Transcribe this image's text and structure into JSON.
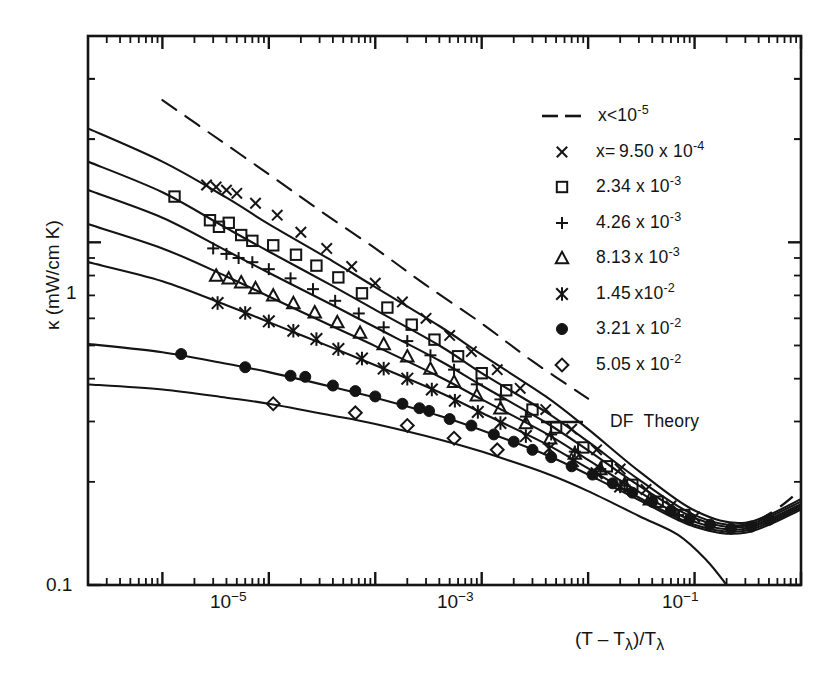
{
  "chart_data": {
    "type": "line",
    "title": "",
    "xlabel": "(T - Tλ)/Tλ",
    "ylabel": "κ (mW/cm K)",
    "xscale": "log",
    "yscale": "log",
    "xlim": [
      2e-07,
      1.0
    ],
    "ylim": [
      0.1,
      4.0
    ],
    "x_tick_labels": [
      "10⁻⁵",
      "10⁻³",
      "10⁻¹"
    ],
    "x_tick_values": [
      1e-05,
      0.001,
      0.1
    ],
    "y_tick_labels": [
      "1",
      "0.1"
    ],
    "y_tick_values": [
      1.0,
      0.1
    ],
    "grid": false,
    "legend_position": "upper-right",
    "series": [
      {
        "name": "x<10⁻⁵",
        "label_html": "x&lt;10<sup>-5</sup>",
        "style": "dashed",
        "marker": "none",
        "points": [
          [
            1e-06,
            2.6
          ],
          [
            3e-06,
            2.05
          ],
          [
            1e-05,
            1.58
          ],
          [
            3e-05,
            1.24
          ],
          [
            0.0001,
            0.96
          ],
          [
            0.0003,
            0.75
          ],
          [
            0.001,
            0.58
          ],
          [
            0.003,
            0.45
          ],
          [
            0.01,
            0.35
          ]
        ]
      },
      {
        "name": "x= 9.50 x 10⁻⁴",
        "label_html": "x=&thinsp;9.50 x 10<sup>-4</sup>",
        "style": "solid",
        "marker": "cross",
        "points": [
          [
            2e-07,
            2.15
          ],
          [
            1e-06,
            1.72
          ],
          [
            4e-06,
            1.35
          ],
          [
            1e-05,
            1.13
          ],
          [
            4e-05,
            0.88
          ],
          [
            0.0001,
            0.74
          ],
          [
            0.0004,
            0.57
          ],
          [
            0.001,
            0.47
          ],
          [
            0.004,
            0.355
          ],
          [
            0.01,
            0.285
          ],
          [
            0.03,
            0.215
          ],
          [
            0.1,
            0.165
          ],
          [
            0.3,
            0.152
          ],
          [
            1.0,
            0.178
          ]
        ],
        "marker_points": [
          [
            2.6e-06,
            1.47
          ],
          [
            3.2e-06,
            1.45
          ],
          [
            4e-06,
            1.42
          ],
          [
            5e-06,
            1.39
          ],
          [
            7.5e-06,
            1.3
          ],
          [
            1.2e-05,
            1.2
          ],
          [
            2e-05,
            1.07
          ],
          [
            3.5e-05,
            0.96
          ],
          [
            6e-05,
            0.85
          ],
          [
            0.0001,
            0.76
          ],
          [
            0.00018,
            0.67
          ],
          [
            0.0003,
            0.6
          ],
          [
            0.0005,
            0.535
          ],
          [
            0.0008,
            0.48
          ],
          [
            0.0014,
            0.425
          ],
          [
            0.0023,
            0.375
          ],
          [
            0.004,
            0.325
          ],
          [
            0.007,
            0.285
          ],
          [
            0.012,
            0.248
          ],
          [
            0.02,
            0.218
          ],
          [
            0.035,
            0.19
          ],
          [
            0.06,
            0.17
          ],
          [
            0.1,
            0.158
          ]
        ]
      },
      {
        "name": "2.34 x 10⁻³",
        "label_html": "2.34 x 10<sup>-3</sup>",
        "style": "solid",
        "marker": "square",
        "points": [
          [
            2e-07,
            1.72
          ],
          [
            1e-06,
            1.4
          ],
          [
            4e-06,
            1.1
          ],
          [
            1e-05,
            0.94
          ],
          [
            4e-05,
            0.745
          ],
          [
            0.0001,
            0.635
          ],
          [
            0.0004,
            0.5
          ],
          [
            0.001,
            0.415
          ],
          [
            0.004,
            0.32
          ],
          [
            0.01,
            0.262
          ],
          [
            0.03,
            0.203
          ],
          [
            0.1,
            0.16
          ],
          [
            0.3,
            0.15
          ],
          [
            1.0,
            0.175
          ]
        ],
        "marker_points": [
          [
            1.3e-06,
            1.36
          ],
          [
            2.8e-06,
            1.16
          ],
          [
            3.4e-06,
            1.11
          ],
          [
            4.2e-06,
            1.14
          ],
          [
            5.5e-06,
            1.05
          ],
          [
            7e-06,
            1.01
          ],
          [
            1.1e-05,
            0.98
          ],
          [
            1.8e-05,
            0.92
          ],
          [
            2.8e-05,
            0.855
          ],
          [
            4.5e-05,
            0.79
          ],
          [
            7.5e-05,
            0.71
          ],
          [
            0.00013,
            0.645
          ],
          [
            0.00022,
            0.575
          ],
          [
            0.00036,
            0.52
          ],
          [
            0.0006,
            0.465
          ],
          [
            0.001,
            0.415
          ],
          [
            0.0017,
            0.37
          ],
          [
            0.003,
            0.325
          ],
          [
            0.005,
            0.288
          ],
          [
            0.009,
            0.252
          ],
          [
            0.015,
            0.222
          ],
          [
            0.026,
            0.196
          ],
          [
            0.045,
            0.175
          ],
          [
            0.08,
            0.16
          ]
        ]
      },
      {
        "name": "4.26 x 10⁻³",
        "label_html": "4.26 x 10<sup>-3</sup>",
        "style": "solid",
        "marker": "plus",
        "points": [
          [
            2e-07,
            1.42
          ],
          [
            1e-06,
            1.18
          ],
          [
            4e-06,
            0.945
          ],
          [
            1e-05,
            0.815
          ],
          [
            4e-05,
            0.655
          ],
          [
            0.0001,
            0.565
          ],
          [
            0.0004,
            0.452
          ],
          [
            0.001,
            0.382
          ],
          [
            0.004,
            0.298
          ],
          [
            0.01,
            0.247
          ],
          [
            0.03,
            0.195
          ],
          [
            0.1,
            0.157
          ],
          [
            0.3,
            0.148
          ],
          [
            1.0,
            0.172
          ]
        ],
        "marker_points": [
          [
            3e-06,
            0.96
          ],
          [
            4e-06,
            0.925
          ],
          [
            5.2e-06,
            0.9
          ],
          [
            7e-06,
            0.875
          ],
          [
            1e-05,
            0.835
          ],
          [
            1.6e-05,
            0.785
          ],
          [
            2.6e-05,
            0.73
          ],
          [
            4.2e-05,
            0.675
          ],
          [
            7e-05,
            0.62
          ],
          [
            0.00012,
            0.565
          ],
          [
            0.0002,
            0.515
          ],
          [
            0.00033,
            0.468
          ],
          [
            0.00055,
            0.425
          ],
          [
            0.0009,
            0.385
          ],
          [
            0.0015,
            0.348
          ],
          [
            0.0026,
            0.31
          ],
          [
            0.0045,
            0.275
          ],
          [
            0.0075,
            0.245
          ],
          [
            0.013,
            0.218
          ],
          [
            0.022,
            0.195
          ],
          [
            0.04,
            0.175
          ],
          [
            0.07,
            0.16
          ]
        ]
      },
      {
        "name": "8.13 x 10⁻³",
        "label_html": "8.13&thinsp;x 10<sup>-3</sup>",
        "style": "solid",
        "marker": "triangle",
        "points": [
          [
            2e-07,
            1.13
          ],
          [
            1e-06,
            0.96
          ],
          [
            4e-06,
            0.795
          ],
          [
            1e-05,
            0.695
          ],
          [
            4e-05,
            0.568
          ],
          [
            0.0001,
            0.498
          ],
          [
            0.0004,
            0.405
          ],
          [
            0.001,
            0.348
          ],
          [
            0.004,
            0.277
          ],
          [
            0.01,
            0.232
          ],
          [
            0.03,
            0.187
          ],
          [
            0.1,
            0.153
          ],
          [
            0.3,
            0.146
          ],
          [
            1.0,
            0.17
          ]
        ],
        "marker_points": [
          [
            3.2e-06,
            0.8
          ],
          [
            4.2e-06,
            0.785
          ],
          [
            5.5e-06,
            0.765
          ],
          [
            7.5e-06,
            0.735
          ],
          [
            1.1e-05,
            0.7
          ],
          [
            1.7e-05,
            0.665
          ],
          [
            2.7e-05,
            0.625
          ],
          [
            4.4e-05,
            0.585
          ],
          [
            7.2e-05,
            0.545
          ],
          [
            0.00012,
            0.505
          ],
          [
            0.0002,
            0.465
          ],
          [
            0.00033,
            0.428
          ],
          [
            0.00055,
            0.392
          ],
          [
            0.0009,
            0.358
          ],
          [
            0.0015,
            0.328
          ],
          [
            0.0026,
            0.297
          ],
          [
            0.0044,
            0.268
          ],
          [
            0.0075,
            0.242
          ],
          [
            0.013,
            0.218
          ],
          [
            0.022,
            0.197
          ],
          [
            0.038,
            0.178
          ]
        ]
      },
      {
        "name": "1.45 x 10⁻²",
        "label_html": "1.45&thinsp;x10<sup>-2</sup>",
        "style": "solid",
        "marker": "asterisk",
        "points": [
          [
            2e-07,
            0.875
          ],
          [
            1e-06,
            0.77
          ],
          [
            4e-06,
            0.655
          ],
          [
            1e-05,
            0.585
          ],
          [
            4e-05,
            0.492
          ],
          [
            0.0001,
            0.438
          ],
          [
            0.0004,
            0.365
          ],
          [
            0.001,
            0.318
          ],
          [
            0.004,
            0.258
          ],
          [
            0.01,
            0.219
          ],
          [
            0.03,
            0.18
          ],
          [
            0.1,
            0.15
          ],
          [
            0.3,
            0.144
          ],
          [
            1.0,
            0.168
          ]
        ],
        "marker_points": [
          [
            3.3e-06,
            0.665
          ],
          [
            6e-06,
            0.622
          ],
          [
            1e-05,
            0.588
          ],
          [
            1.7e-05,
            0.552
          ],
          [
            2.8e-05,
            0.522
          ],
          [
            4.5e-05,
            0.488
          ],
          [
            7.5e-05,
            0.458
          ],
          [
            0.00012,
            0.428
          ],
          [
            0.0002,
            0.4
          ],
          [
            0.00034,
            0.372
          ],
          [
            0.00056,
            0.345
          ],
          [
            0.00092,
            0.32
          ],
          [
            0.0015,
            0.297
          ],
          [
            0.0026,
            0.272
          ],
          [
            0.0043,
            0.25
          ],
          [
            0.0072,
            0.23
          ],
          [
            0.012,
            0.212
          ],
          [
            0.02,
            0.194
          ]
        ]
      },
      {
        "name": "3.21 x 10⁻²",
        "label_html": "3.21 x 10<sup>-2</sup>",
        "style": "solid",
        "marker": "filled-circle",
        "points": [
          [
            2e-07,
            0.505
          ],
          [
            1e-06,
            0.478
          ],
          [
            4e-06,
            0.442
          ],
          [
            1e-05,
            0.418
          ],
          [
            4e-05,
            0.378
          ],
          [
            0.0001,
            0.352
          ],
          [
            0.0004,
            0.312
          ],
          [
            0.001,
            0.283
          ],
          [
            0.004,
            0.24
          ],
          [
            0.01,
            0.21
          ],
          [
            0.03,
            0.177
          ],
          [
            0.1,
            0.148
          ],
          [
            0.3,
            0.142
          ],
          [
            1.0,
            0.166
          ]
        ],
        "marker_points": [
          [
            1.5e-06,
            0.472
          ],
          [
            6e-06,
            0.432
          ],
          [
            1.6e-05,
            0.408
          ],
          [
            2.2e-05,
            0.405
          ],
          [
            4e-05,
            0.382
          ],
          [
            6.5e-05,
            0.368
          ],
          [
            0.0001,
            0.355
          ],
          [
            0.00018,
            0.338
          ],
          [
            0.00026,
            0.328
          ],
          [
            0.00032,
            0.322
          ],
          [
            0.0005,
            0.305
          ],
          [
            0.0008,
            0.292
          ],
          [
            0.0013,
            0.275
          ],
          [
            0.002,
            0.262
          ],
          [
            0.003,
            0.248
          ],
          [
            0.0045,
            0.236
          ],
          [
            0.007,
            0.222
          ],
          [
            0.011,
            0.21
          ],
          [
            0.017,
            0.198
          ],
          [
            0.026,
            0.186
          ],
          [
            0.04,
            0.175
          ],
          [
            0.06,
            0.165
          ],
          [
            0.09,
            0.156
          ],
          [
            0.14,
            0.15
          ],
          [
            0.22,
            0.146
          ],
          [
            0.34,
            0.148
          ],
          [
            0.5,
            0.155
          ]
        ]
      },
      {
        "name": "5.05 x 10⁻²",
        "label_html": "5.05 x 10<sup>-2</sup>",
        "style": "solid",
        "marker": "diamond",
        "points": [
          [
            2e-07,
            0.385
          ],
          [
            1e-06,
            0.372
          ],
          [
            4e-06,
            0.352
          ],
          [
            1e-05,
            0.338
          ],
          [
            4e-05,
            0.312
          ],
          [
            0.0001,
            0.295
          ],
          [
            0.0004,
            0.266
          ],
          [
            0.001,
            0.245
          ],
          [
            0.004,
            0.212
          ],
          [
            0.01,
            0.188
          ],
          [
            0.03,
            0.159
          ],
          [
            0.07,
            0.14
          ],
          [
            0.13,
            0.118
          ],
          [
            0.2,
            0.1
          ]
        ],
        "marker_points": [
          [
            1.1e-05,
            0.338
          ],
          [
            6.5e-05,
            0.318
          ],
          [
            0.0002,
            0.292
          ],
          [
            0.00055,
            0.268
          ],
          [
            0.0014,
            0.248
          ]
        ]
      }
    ],
    "theory_label": "DF Theory",
    "theory_style": "solid"
  },
  "legend": {
    "entries": [
      {
        "marker": "dashed-line",
        "label": "x<10⁻⁵",
        "html": "x&lt;10<sup>-5</sup>"
      },
      {
        "marker": "cross",
        "label": "x= 9.50 x 10⁻⁴",
        "html": "x=&thinsp;9.50 x 10<sup>-4</sup>"
      },
      {
        "marker": "square",
        "label": "2.34 x 10⁻³",
        "html": "2.34 x 10<sup>-3</sup>"
      },
      {
        "marker": "plus",
        "label": "4.26 x 10⁻³",
        "html": "4.26 x 10<sup>-3</sup>"
      },
      {
        "marker": "triangle",
        "label": "8.13 x 10⁻³",
        "html": "8.13&thinsp;x 10<sup>-3</sup>"
      },
      {
        "marker": "asterisk",
        "label": "1.45 x 10⁻²",
        "html": "1.45&thinsp;x10<sup>-2</sup>"
      },
      {
        "marker": "filled-circle",
        "label": "3.21 x 10⁻²",
        "html": "3.21 x 10<sup>-2</sup>"
      },
      {
        "marker": "diamond",
        "label": "5.05 x 10⁻²",
        "html": "5.05 x 10<sup>-2</sup>"
      },
      {
        "marker": "solid-line",
        "label": "DF Theory",
        "html": "DF&nbsp; Theory"
      }
    ]
  },
  "axes": {
    "y_title": "κ (mW/cm K)",
    "x_title_html": "(T &ndash; T<sub>λ</sub>)/T<sub>λ</sub>",
    "y_ticks": [
      "1",
      "0.1"
    ],
    "x_ticks": [
      {
        "html": "10<sup>-5</sup>"
      },
      {
        "html": "10<sup>-3</sup>"
      },
      {
        "html": "10<sup>-1</sup>"
      }
    ]
  }
}
